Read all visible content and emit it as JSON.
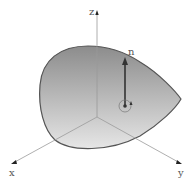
{
  "diagram": {
    "type": "3d-surface-with-normal",
    "axes": {
      "x": {
        "label": "x"
      },
      "y": {
        "label": "y"
      },
      "z": {
        "label": "z"
      }
    },
    "normal_vector": {
      "label": "n"
    },
    "colors": {
      "surface_top": "#8a8a8a",
      "surface_bottom": "#e8e8e8",
      "outline": "#555555",
      "axis": "#999999",
      "vector": "#333333"
    }
  }
}
